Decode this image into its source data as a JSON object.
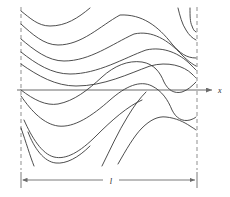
{
  "figure": {
    "title": "",
    "axis": {
      "name": "x-axis",
      "label": "x",
      "label_x": 218,
      "label_y": 91,
      "y": 90,
      "x_start": 17,
      "x_end": 212,
      "arrow": true,
      "color": "#6b6b6b"
    },
    "boundaries": {
      "name": "dashed-vertical-boundaries",
      "left_x": 21,
      "right_x": 197,
      "y_top": 7,
      "y_bottom": 170,
      "style": "dashed",
      "color": "#9a9a9a"
    },
    "dimension": {
      "name": "width-dimension",
      "label": "l",
      "label_x": 110,
      "label_y": 182,
      "y": 180,
      "x_start": 21,
      "x_end": 197,
      "arrows": "both",
      "color": "#6b6b6b"
    },
    "curve_color": "#3a3a3a",
    "curve_width": 0.9,
    "background": "#ffffff"
  },
  "chart_data": {
    "type": "line",
    "title": "",
    "xlabel": "x",
    "ylabel": "",
    "grid": false,
    "legend": "none",
    "xlim": [
      21,
      197
    ],
    "ylim": [
      7,
      170
    ],
    "annotations": [
      {
        "text": "x",
        "x": 218,
        "y": 91,
        "role": "axis-label"
      },
      {
        "text": "l",
        "x": 110,
        "y": 182,
        "role": "dimension-label"
      }
    ],
    "series": [
      {
        "name": "curve-1",
        "path": "M 21,11 C 30,18 38,26 50,26 C 66,26 78,18 90,8",
        "points": [
          [
            21,
            11
          ],
          [
            35,
            22
          ],
          [
            50,
            26
          ],
          [
            70,
            22
          ],
          [
            90,
            8
          ]
        ]
      },
      {
        "name": "curve-2",
        "path": "M 21,24 C 32,34 44,45 58,45 C 82,45 100,26 120,15 C 142,14 158,26 172,44 C 180,53 186,58 196,58",
        "points": [
          [
            21,
            24
          ],
          [
            40,
            41
          ],
          [
            58,
            45
          ],
          [
            90,
            31
          ],
          [
            120,
            15
          ],
          [
            150,
            22
          ],
          [
            172,
            44
          ],
          [
            196,
            58
          ]
        ]
      },
      {
        "name": "curve-3",
        "path": "M 21,39 C 34,50 48,61 64,61 C 90,61 112,44 134,34 C 152,30 168,40 182,55 C 188,61 192,64 196,66",
        "points": [
          [
            21,
            39
          ],
          [
            44,
            57
          ],
          [
            64,
            61
          ],
          [
            100,
            50
          ],
          [
            134,
            34
          ],
          [
            160,
            36
          ],
          [
            182,
            55
          ],
          [
            196,
            66
          ]
        ]
      },
      {
        "name": "curve-4",
        "path": "M 21,52 C 36,64 52,74 70,74 C 98,74 124,58 146,50 C 164,46 180,54 190,64 C 193,67 195,69 196,70",
        "points": [
          [
            21,
            52
          ],
          [
            48,
            70
          ],
          [
            70,
            74
          ],
          [
            110,
            64
          ],
          [
            146,
            50
          ],
          [
            172,
            52
          ],
          [
            190,
            64
          ],
          [
            196,
            70
          ]
        ]
      },
      {
        "name": "curve-5",
        "path": "M 21,64 C 38,76 56,86 76,86 C 104,86 128,74 150,66 C 168,61 184,66 192,74 C 194,76 195,77 196,78",
        "points": [
          [
            21,
            64
          ],
          [
            52,
            82
          ],
          [
            76,
            86
          ],
          [
            114,
            78
          ],
          [
            150,
            66
          ],
          [
            176,
            66
          ],
          [
            192,
            74
          ],
          [
            196,
            78
          ]
        ]
      },
      {
        "name": "curve-6",
        "path": "M 21,90 C 34,100 46,106 58,104 C 74,101 88,90 102,77 C 114,66 128,60 142,62 C 154,64 160,72 164,82 C 168,90 174,94 182,92 C 188,90 192,86 196,82",
        "points": [
          [
            21,
            90
          ],
          [
            46,
            105
          ],
          [
            70,
            95
          ],
          [
            102,
            77
          ],
          [
            142,
            62
          ],
          [
            164,
            82
          ],
          [
            182,
            92
          ],
          [
            196,
            82
          ]
        ]
      },
      {
        "name": "curve-7",
        "path": "M 21,96 C 32,112 44,124 58,126 C 74,128 92,116 110,100 C 126,86 140,80 152,86 C 162,91 168,100 172,110 C 176,118 182,122 190,120 C 193,119 195,118 196,117",
        "points": [
          [
            21,
            96
          ],
          [
            44,
            122
          ],
          [
            58,
            126
          ],
          [
            88,
            110
          ],
          [
            124,
            88
          ],
          [
            152,
            86
          ],
          [
            172,
            110
          ],
          [
            196,
            117
          ]
        ]
      },
      {
        "name": "curve-8",
        "path": "M 24,120 C 32,138 42,154 54,157 C 66,160 80,152 96,136 C 112,120 128,106 142,100",
        "points": [
          [
            24,
            120
          ],
          [
            42,
            150
          ],
          [
            54,
            157
          ],
          [
            78,
            146
          ],
          [
            110,
            122
          ],
          [
            142,
            100
          ]
        ]
      },
      {
        "name": "curve-9",
        "path": "M 28,132 C 34,148 44,162 56,163 C 66,164 78,158 90,146",
        "points": [
          [
            28,
            132
          ],
          [
            44,
            158
          ],
          [
            56,
            163
          ],
          [
            76,
            158
          ],
          [
            90,
            146
          ]
        ]
      },
      {
        "name": "curve-10",
        "path": "M 102,166 C 110,150 118,132 128,116 C 134,106 140,98 146,92",
        "points": [
          [
            102,
            166
          ],
          [
            116,
            136
          ],
          [
            128,
            116
          ],
          [
            146,
            92
          ]
        ]
      },
      {
        "name": "curve-11",
        "path": "M 118,164 C 126,150 134,136 142,128 C 150,120 158,116 166,117 C 176,118 184,122 190,126 C 193,128 195,129 196,130",
        "points": [
          [
            118,
            164
          ],
          [
            132,
            140
          ],
          [
            146,
            124
          ],
          [
            166,
            117
          ],
          [
            186,
            124
          ],
          [
            196,
            130
          ]
        ]
      },
      {
        "name": "curve-12",
        "path": "M 178,8 C 180,16 182,24 186,30 C 189,35 192,38 196,40",
        "points": [
          [
            178,
            8
          ],
          [
            183,
            26
          ],
          [
            190,
            36
          ],
          [
            196,
            40
          ]
        ]
      },
      {
        "name": "curve-13",
        "path": "M 190,8 C 190,16 190,22 192,26 C 193,29 194,31 196,32",
        "points": [
          [
            190,
            8
          ],
          [
            191,
            22
          ],
          [
            196,
            32
          ]
        ]
      },
      {
        "name": "curve-14",
        "path": "M 21,128 C 26,142 30,156 34,166",
        "points": [
          [
            21,
            128
          ],
          [
            28,
            150
          ],
          [
            34,
            166
          ]
        ]
      }
    ]
  }
}
